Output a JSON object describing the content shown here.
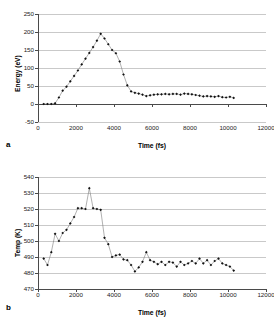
{
  "figure": {
    "panel_a_letter": "a",
    "panel_b_letter": "b"
  },
  "chart_data": [
    {
      "type": "line",
      "panel": "a",
      "title": "",
      "xlabel": "Time (fs)",
      "ylabel": "Energy (eV)",
      "xlim": [
        0,
        12000
      ],
      "ylim": [
        -50,
        250
      ],
      "xticks": [
        0,
        2000,
        4000,
        6000,
        8000,
        10000,
        12000
      ],
      "xtick_labels": [
        "0",
        "2000",
        "4000",
        "6000",
        "8000",
        "10000",
        "12000"
      ],
      "yticks": [
        -50,
        0,
        50,
        100,
        150,
        200,
        250
      ],
      "ytick_labels": [
        "-50",
        "0",
        "50",
        "100",
        "150",
        "200",
        "250"
      ],
      "grid": true,
      "legend": "none",
      "marker": "filled-diamond",
      "x": [
        300,
        500,
        700,
        900,
        1100,
        1300,
        1500,
        1700,
        1900,
        2100,
        2300,
        2500,
        2700,
        2900,
        3100,
        3300,
        3500,
        3700,
        3900,
        4100,
        4300,
        4500,
        4700,
        4900,
        5100,
        5300,
        5500,
        5700,
        5900,
        6100,
        6300,
        6500,
        6700,
        6900,
        7100,
        7300,
        7500,
        7700,
        7900,
        8100,
        8300,
        8500,
        8700,
        8900,
        9100,
        9300,
        9500,
        9700,
        9900,
        10100,
        10300
      ],
      "y": [
        0,
        0,
        0,
        2,
        18,
        37,
        48,
        63,
        78,
        93,
        110,
        126,
        142,
        158,
        176,
        195,
        182,
        166,
        150,
        141,
        118,
        82,
        52,
        35,
        31,
        29,
        26,
        22,
        24,
        26,
        27,
        27,
        28,
        27,
        28,
        28,
        26,
        29,
        28,
        27,
        25,
        23,
        21,
        22,
        21,
        20,
        22,
        19,
        18,
        20,
        17
      ],
      "series": [
        {
          "name": "Energy",
          "values": [
            0,
            0,
            0,
            2,
            18,
            37,
            48,
            63,
            78,
            93,
            110,
            126,
            142,
            158,
            176,
            195,
            182,
            166,
            150,
            141,
            118,
            82,
            52,
            35,
            31,
            29,
            26,
            22,
            24,
            26,
            27,
            27,
            28,
            27,
            28,
            28,
            26,
            29,
            28,
            27,
            25,
            23,
            21,
            22,
            21,
            20,
            22,
            19,
            18,
            20,
            17
          ]
        }
      ]
    },
    {
      "type": "line",
      "panel": "b",
      "title": "",
      "xlabel": "Time (fs)",
      "ylabel": "Temp (K)",
      "xlim": [
        0,
        12000
      ],
      "ylim": [
        470,
        540
      ],
      "xticks": [
        0,
        2000,
        4000,
        6000,
        8000,
        10000,
        12000
      ],
      "xtick_labels": [
        "0",
        "2000",
        "4000",
        "6000",
        "8000",
        "10000",
        "12000"
      ],
      "yticks": [
        470,
        480,
        490,
        500,
        510,
        520,
        530,
        540
      ],
      "ytick_labels": [
        "470",
        "480",
        "490",
        "500",
        "510",
        "520",
        "530",
        "540"
      ],
      "grid": true,
      "legend": "none",
      "marker": "filled-diamond",
      "x": [
        300,
        500,
        700,
        900,
        1100,
        1300,
        1500,
        1700,
        1900,
        2100,
        2300,
        2500,
        2700,
        2900,
        3100,
        3300,
        3500,
        3700,
        3900,
        4100,
        4300,
        4500,
        4700,
        4900,
        5100,
        5300,
        5500,
        5700,
        5900,
        6100,
        6300,
        6500,
        6700,
        6900,
        7100,
        7300,
        7500,
        7700,
        7900,
        8100,
        8300,
        8500,
        8700,
        8900,
        9100,
        9300,
        9500,
        9700,
        9900,
        10100,
        10300
      ],
      "y": [
        489,
        485,
        493,
        504.5,
        500,
        505,
        507,
        511,
        515,
        520.5,
        520.5,
        520,
        533,
        520.5,
        520,
        519.5,
        502,
        498,
        490,
        491,
        491.5,
        488.5,
        488,
        485,
        481,
        483.5,
        487,
        493,
        488,
        487,
        485.5,
        487,
        485,
        487,
        486.5,
        484,
        487,
        485,
        486,
        487.5,
        486,
        489,
        486,
        488,
        485,
        487.5,
        489,
        486,
        485,
        484,
        481.5
      ],
      "series": [
        {
          "name": "Temp",
          "values": [
            489,
            485,
            493,
            504.5,
            500,
            505,
            507,
            511,
            515,
            520.5,
            520.5,
            520,
            533,
            520.5,
            520,
            519.5,
            502,
            498,
            490,
            491,
            491.5,
            488.5,
            488,
            485,
            481,
            483.5,
            487,
            493,
            488,
            487,
            485.5,
            487,
            485,
            487,
            486.5,
            484,
            487,
            485,
            486,
            487.5,
            486,
            489,
            486,
            488,
            485,
            487.5,
            489,
            486,
            485,
            484,
            481.5
          ]
        }
      ]
    }
  ]
}
